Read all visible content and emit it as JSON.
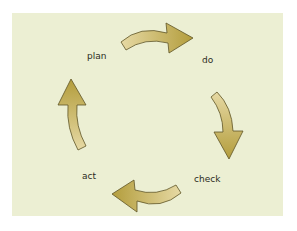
{
  "diagram": {
    "type": "cycle",
    "title": "",
    "stages": [
      {
        "id": "plan",
        "label": "plan"
      },
      {
        "id": "do",
        "label": "do"
      },
      {
        "id": "check",
        "label": "check"
      },
      {
        "id": "act",
        "label": "act"
      }
    ],
    "edges": [
      {
        "from": "plan",
        "to": "do",
        "direction": "clockwise"
      },
      {
        "from": "do",
        "to": "check",
        "direction": "clockwise"
      },
      {
        "from": "check",
        "to": "act",
        "direction": "clockwise"
      },
      {
        "from": "act",
        "to": "plan",
        "direction": "clockwise"
      }
    ],
    "colors": {
      "background": "#ecefd3",
      "arrow_fill_light": "#e2d49a",
      "arrow_fill_dark": "#b7a241",
      "arrow_stroke": "#5e5426",
      "label_text": "#2b2b22"
    }
  }
}
